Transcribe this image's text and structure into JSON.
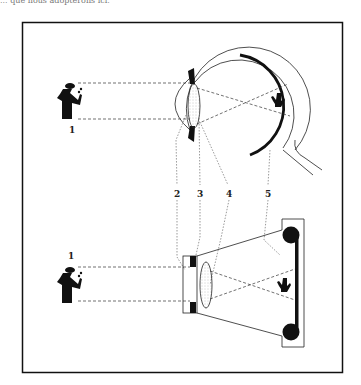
{
  "caption": "... que nous adopterons ici.",
  "diagram": {
    "labels": {
      "object_top": "1",
      "object_bottom": "1",
      "l2": "2",
      "l3": "3",
      "l4": "4",
      "l5": "5"
    },
    "legend": [
      {
        "number": "1",
        "meaning": "object"
      },
      {
        "number": "2",
        "meaning": "chamber / aperture"
      },
      {
        "number": "3",
        "meaning": "iris / diaphragm"
      },
      {
        "number": "4",
        "meaning": "lens"
      },
      {
        "number": "5",
        "meaning": "retina / film"
      }
    ],
    "colors": {
      "ink": "#111111",
      "paper": "#ffffff"
    }
  }
}
